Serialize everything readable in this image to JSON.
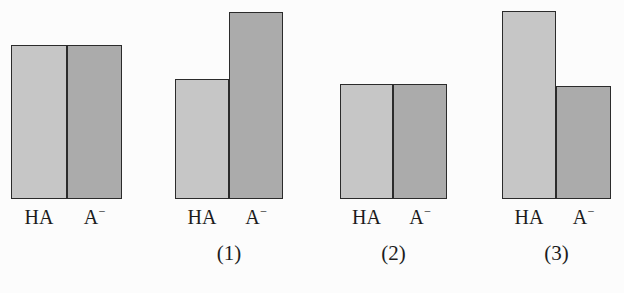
{
  "figure": {
    "width": 624,
    "height": 293,
    "background_color": "#fcfcfc",
    "baseline_y": 199,
    "colors": {
      "bar_light": "#c6c6c6",
      "bar_dark": "#ababab",
      "outline": "#2b2b2b",
      "text": "#1c1c1c"
    }
  },
  "chart_data": {
    "type": "bar",
    "title": "",
    "xlabel": "",
    "ylabel": "",
    "grid": false,
    "legend": "none",
    "categories": [
      "HA",
      "A⁻"
    ],
    "panels": [
      {
        "caption": "",
        "labels": [
          "HA",
          "A⁻"
        ],
        "values": [
          154,
          154
        ],
        "bar_styles": [
          "light",
          "dark"
        ],
        "left_px": 11,
        "divider_px": 67,
        "right_px": 122,
        "tops_px": [
          45,
          45
        ]
      },
      {
        "caption": "(1)",
        "labels": [
          "HA",
          "A⁻"
        ],
        "values": [
          120,
          187
        ],
        "bar_styles": [
          "light",
          "dark"
        ],
        "left_px": 175,
        "divider_px": 229,
        "right_px": 283,
        "tops_px": [
          79,
          12
        ]
      },
      {
        "caption": "(2)",
        "labels": [
          "HA",
          "A⁻"
        ],
        "values": [
          115,
          115
        ],
        "bar_styles": [
          "light",
          "dark"
        ],
        "left_px": 340,
        "divider_px": 393,
        "right_px": 447,
        "tops_px": [
          84,
          84
        ]
      },
      {
        "caption": "(3)",
        "labels": [
          "HA",
          "A⁻"
        ],
        "values": [
          188,
          113
        ],
        "bar_styles": [
          "light",
          "dark"
        ],
        "left_px": 502,
        "divider_px": 556,
        "right_px": 611,
        "tops_px": [
          11,
          86
        ]
      }
    ]
  }
}
